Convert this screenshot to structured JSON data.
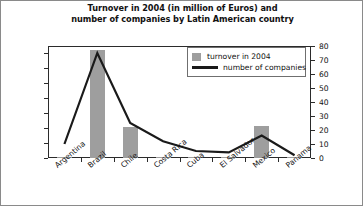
{
  "chart_data": {
    "type": "bar",
    "title": "Turnover in 2004 (in million of Euros) and number of companies by Latin American country",
    "title_line1": "Turnover in 2004 (in million of Euros) and",
    "title_line2": "number of companies by Latin American country",
    "xlabel": "",
    "ylabel": "",
    "categories": [
      "Argentina",
      "Brazil",
      "Chile",
      "Costa Rica",
      "Cuba",
      "El Salvador",
      "Mexico",
      "Panama"
    ],
    "series": [
      {
        "name": "turnover in 2004",
        "type": "bar",
        "axis": "left",
        "color": "#9e9e9e",
        "values": [
          60,
          14500,
          4200,
          80,
          60,
          60,
          4300,
          60
        ]
      },
      {
        "name": "number of companies",
        "type": "line",
        "axis": "right",
        "color": "#1a1a1a",
        "values": [
          10,
          75,
          25,
          12,
          5,
          4,
          16,
          2
        ]
      }
    ],
    "left_axis": {
      "ylim": [
        0,
        15000
      ],
      "ticks": [
        0,
        2000,
        4000,
        6000,
        8000,
        10000,
        12000,
        14000
      ],
      "tick_labels": [
        "0",
        "2,000",
        "4,000",
        "6,000",
        "8,000",
        "10,000",
        "12,000",
        "14,000"
      ]
    },
    "right_axis": {
      "ylim": [
        0,
        80
      ],
      "ticks": [
        0,
        10,
        20,
        30,
        40,
        50,
        60,
        70,
        80
      ],
      "tick_labels": [
        "0",
        "10",
        "20",
        "30",
        "40",
        "50",
        "60",
        "70",
        "80"
      ]
    },
    "legend": {
      "position": "top-right-inside",
      "entries": [
        {
          "label": "turnover in 2004",
          "marker": "square",
          "color": "#9e9e9e"
        },
        {
          "label": "number of companies",
          "marker": "line",
          "color": "#1a1a1a"
        }
      ]
    },
    "grid": false
  }
}
